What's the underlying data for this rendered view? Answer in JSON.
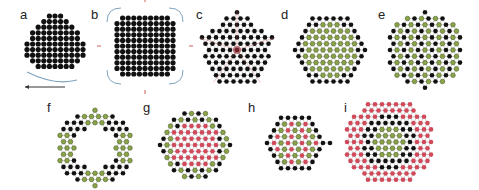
{
  "figure": {
    "colors": {
      "black_node": "#111111",
      "green_node": "#8aa34a",
      "green_stroke": "#4f6325",
      "red_node": "#d04a5c",
      "bond": "#9a9a9a",
      "arrow_red": "#d0605a",
      "arrow_blue": "#7fa4c0"
    },
    "panels": [
      {
        "id": "a",
        "label": "a",
        "label_x": 20,
        "label_y": 8,
        "cx": 55,
        "cy": 44,
        "shape": "blob",
        "r": 32,
        "pattern": "dense_black",
        "desc": "dense black disordered cluster with curved arrow below"
      },
      {
        "id": "b",
        "label": "b",
        "label_x": 91,
        "label_y": 8,
        "cx": 145,
        "cy": 46,
        "shape": "rounded_square",
        "r": 34,
        "pattern": "dense_black",
        "desc": "square lattice of black dots with red arrows and blue corner arcs"
      },
      {
        "id": "c",
        "label": "c",
        "label_x": 196,
        "label_y": 8,
        "cx": 237,
        "cy": 50,
        "shape": "pentagon",
        "r": 40,
        "pattern": "black",
        "desc": "pentagonal cluster with red center and radial lines"
      },
      {
        "id": "d",
        "label": "d",
        "label_x": 281,
        "label_y": 8,
        "cx": 330,
        "cy": 50,
        "shape": "hexagon",
        "r": 40,
        "pattern": "green_core_black_shell",
        "desc": "hexagon with green core and black shell"
      },
      {
        "id": "e",
        "label": "e",
        "label_x": 378,
        "label_y": 8,
        "cx": 425,
        "cy": 50,
        "shape": "circle",
        "r": 38,
        "pattern": "green_black_mixed",
        "desc": "circular cluster with alternating green and black"
      },
      {
        "id": "f",
        "label": "f",
        "label_x": 47,
        "label_y": 101,
        "cx": 95,
        "cy": 148,
        "shape": "ring",
        "r": 38,
        "pattern": "ring_green_black",
        "desc": "ring with green segments and black links"
      },
      {
        "id": "g",
        "label": "g",
        "label_x": 143,
        "label_y": 101,
        "cx": 195,
        "cy": 145,
        "shape": "circle",
        "r": 36,
        "pattern": "red_core_green_shell",
        "desc": "red core surrounded by green/black shell"
      },
      {
        "id": "h",
        "label": "h",
        "label_x": 248,
        "label_y": 101,
        "cx": 295,
        "cy": 143,
        "shape": "hexagon",
        "r": 35,
        "pattern": "green_red_core_black_shell",
        "desc": "hexagon with green/red core and black shell"
      },
      {
        "id": "i",
        "label": "i",
        "label_x": 344,
        "label_y": 101,
        "cx": 389,
        "cy": 142,
        "shape": "circle",
        "r": 44,
        "pattern": "green_core_black_mid_red_shell",
        "desc": "green core, black middle, red outer shell"
      }
    ]
  }
}
